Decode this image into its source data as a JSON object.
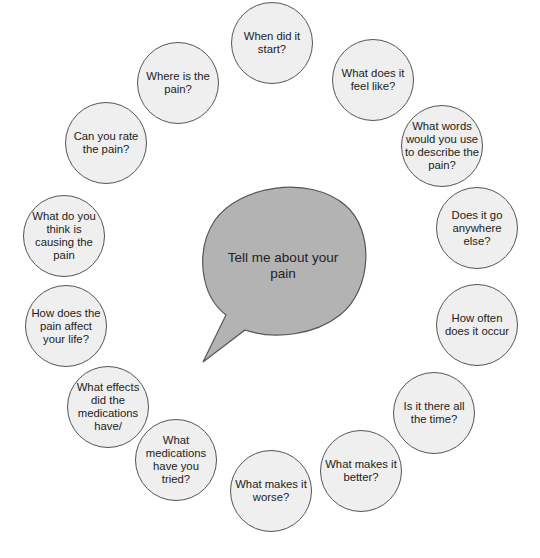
{
  "center": {
    "text": "Tell me about your pain",
    "fill": "#b3b3b3",
    "stroke": "#555555"
  },
  "questions": [
    {
      "text": "When did it start?",
      "cx": 272,
      "cy": 43
    },
    {
      "text": "What does it feel like?",
      "cx": 373,
      "cy": 80
    },
    {
      "text": "What words would you use to describe the pain?",
      "cx": 442,
      "cy": 146
    },
    {
      "text": "Does it go anywhere else?",
      "cx": 477,
      "cy": 228
    },
    {
      "text": "How often does it occur",
      "cx": 477,
      "cy": 325
    },
    {
      "text": "Is it there all the time?",
      "cx": 434,
      "cy": 413
    },
    {
      "text": "What makes it better?",
      "cx": 361,
      "cy": 471
    },
    {
      "text": "What makes it worse?",
      "cx": 271,
      "cy": 491
    },
    {
      "text": "What medications have you tried?",
      "cx": 176,
      "cy": 460
    },
    {
      "text": "What effects did the medications have/",
      "cx": 108,
      "cy": 407
    },
    {
      "text": "How does the pain affect your life?",
      "cx": 66,
      "cy": 326
    },
    {
      "text": "What do you think is causing the pain",
      "cx": 64,
      "cy": 236
    },
    {
      "text": "Can you rate the pain?",
      "cx": 106,
      "cy": 143
    },
    {
      "text": "Where is the pain?",
      "cx": 178,
      "cy": 83
    }
  ],
  "colors": {
    "circle_fill": "#efefef",
    "circle_stroke": "#555555",
    "text": "#222222"
  }
}
